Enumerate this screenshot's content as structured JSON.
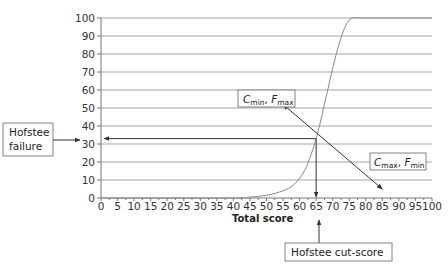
{
  "chart_data": {
    "type": "line",
    "title": "",
    "xlabel": "Total score",
    "ylabel": "",
    "xlim": [
      0,
      100
    ],
    "ylim": [
      0,
      100
    ],
    "grid": "horizontal",
    "x_ticks": [
      "0",
      "5",
      "10",
      "15",
      "20",
      "25",
      "30",
      "35",
      "40",
      "45",
      "50",
      "55",
      "60",
      "65",
      "70",
      "75",
      "80",
      "85",
      "90",
      "95",
      "100"
    ],
    "y_ticks": [
      "0",
      "10",
      "20",
      "30",
      "40",
      "50",
      "60",
      "70",
      "80",
      "90",
      "100"
    ],
    "series": [
      {
        "name": "Cumulative % of candidates failing",
        "x": [
          0,
          40,
          45,
          50,
          55,
          58,
          60,
          62,
          64,
          65,
          66,
          68,
          70,
          72,
          74,
          76,
          80,
          100
        ],
        "y": [
          0,
          0,
          0.5,
          1.5,
          4,
          7,
          11,
          17,
          27,
          33,
          40,
          56,
          72,
          86,
          96,
          100,
          100,
          100
        ]
      },
      {
        "name": "Hofstee line",
        "x": [
          55,
          85
        ],
        "y": [
          52,
          5
        ]
      }
    ],
    "annotations": [
      {
        "text": "Hofstee failure",
        "points_to": {
          "y": 33
        }
      },
      {
        "text": "Hofstee cut-score",
        "points_to": {
          "x": 65
        }
      },
      {
        "text": "Cmin, Fmax",
        "points_to": {
          "x": 55,
          "y": 52
        }
      },
      {
        "text": "Cmax, Fmin",
        "points_to": {
          "x": 85,
          "y": 5
        }
      }
    ],
    "intersection": {
      "x": 65,
      "y": 33
    }
  },
  "labels": {
    "failure_line1": "Hofstee",
    "failure_line2": "failure",
    "cutscore": "Hofstee cut-score",
    "cmin_c": "C",
    "cmin_sub": "min",
    "cmin_sep": ", ",
    "cmin_f": "F",
    "cmin_fsub": "max",
    "cmax_c": "C",
    "cmax_sub": "max",
    "cmax_sep": ", ",
    "cmax_f": "F",
    "cmax_fsub": "min",
    "xaxis_title": "Total score"
  }
}
